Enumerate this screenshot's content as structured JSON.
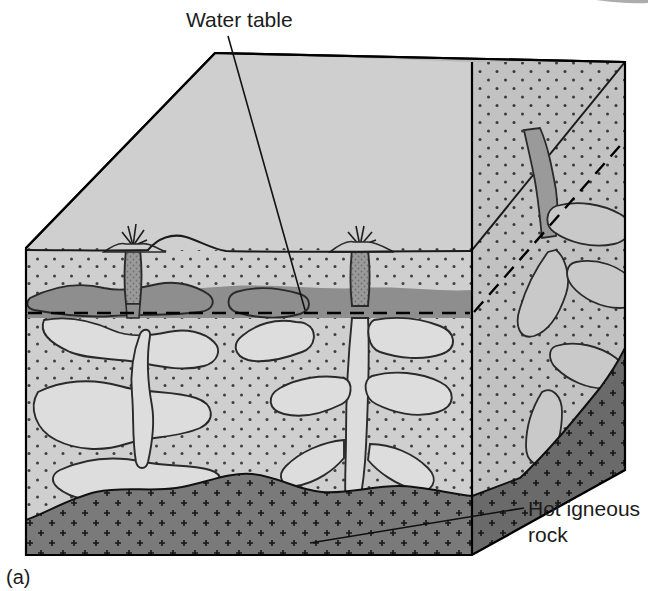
{
  "figure": {
    "caption": "(a)",
    "labels": {
      "water_table": "Water table",
      "hot_rock_line1": "Hot igneous",
      "hot_rock_line2": "rock"
    }
  },
  "colors": {
    "background": "#ffffff",
    "top_surface": "#b9b9b9",
    "front_rock": "#cfcfcf",
    "side_rock": "#c2c2c2",
    "saturated_zone": "#8e8e8e",
    "cave_void": "#dddddd",
    "conduit_water": "#9a9a9a",
    "igneous_front": "#7a7a7a",
    "igneous_side": "#6a6a6a",
    "outline": "#000000",
    "text": "#1c1c1c"
  },
  "scene": {
    "block_type": "geologic-block-diagram",
    "faces": [
      "top-surface",
      "front-cross-section",
      "right-cross-section"
    ],
    "surface_features": {
      "volcano_cones": 1,
      "tree_clusters": [
        {
          "position": "left",
          "count": 2
        },
        {
          "position": "center",
          "count": 3
        },
        {
          "position": "right",
          "count": 2
        }
      ],
      "grass_dashes": true
    },
    "subsurface_features": {
      "geysers": 2,
      "cave_network": true,
      "water_table_dashed": true,
      "saturated_zone": true,
      "hot_igneous_basement": true
    }
  }
}
